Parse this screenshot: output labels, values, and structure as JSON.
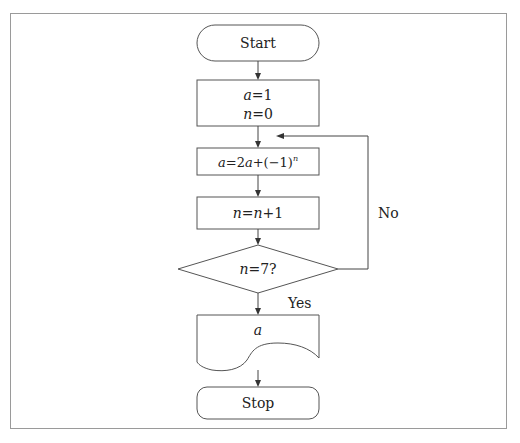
{
  "flowchart": {
    "start": {
      "label": "Start"
    },
    "init": {
      "line1_var": "a",
      "line1_rest": "=1",
      "line2_var": "n",
      "line2_rest": "=0"
    },
    "update_a": {
      "lhs": "a",
      "eq": "=2",
      "a2": "a",
      "rest": "+(−1)",
      "exp": "n"
    },
    "increment": {
      "v1": "n",
      "eq": "=",
      "v2": "n",
      "rest": "+1"
    },
    "decision": {
      "var": "n",
      "rest": "=7?"
    },
    "output": {
      "var": "a"
    },
    "stop": {
      "label": "Stop"
    },
    "edges": {
      "yes_label": "Yes",
      "no_label": "No"
    }
  },
  "colors": {
    "stroke": "#555555",
    "background": "#ffffff",
    "frame": "#9a9a9a",
    "text": "#222222"
  }
}
